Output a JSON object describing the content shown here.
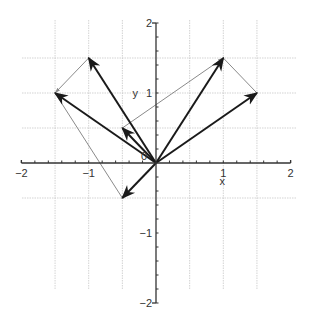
{
  "diagram": {
    "title": "",
    "axes": {
      "x_label": "x",
      "y_label": "y",
      "x_ticks": [
        {
          "value": -2,
          "label": "−2"
        },
        {
          "value": -1,
          "label": "−1"
        },
        {
          "value": 1,
          "label": "1"
        },
        {
          "value": 2,
          "label": "2"
        }
      ],
      "y_ticks": [
        {
          "value": 2,
          "label": "2"
        },
        {
          "value": 1,
          "label": "1"
        },
        {
          "value": -1,
          "label": "−1"
        },
        {
          "value": -2,
          "label": "−2"
        }
      ],
      "origin_label": "0",
      "xlim": [
        -2,
        2
      ],
      "ylim": [
        -2,
        2
      ],
      "grid_step": 0.5
    },
    "vectors": [
      {
        "from": [
          0,
          0
        ],
        "to": [
          -1,
          1.5
        ],
        "style": "bold-arrow"
      },
      {
        "from": [
          0,
          0
        ],
        "to": [
          -1.5,
          1
        ],
        "style": "bold-arrow"
      },
      {
        "from": [
          0,
          0
        ],
        "to": [
          1,
          1.5
        ],
        "style": "bold-arrow"
      },
      {
        "from": [
          0,
          0
        ],
        "to": [
          1.5,
          1
        ],
        "style": "bold-arrow"
      },
      {
        "from": [
          0,
          0
        ],
        "to": [
          -0.5,
          0.5
        ],
        "style": "bold-arrow"
      },
      {
        "from": [
          0,
          0
        ],
        "to": [
          -0.5,
          -0.5
        ],
        "style": "bold-arrow"
      }
    ],
    "segments": [
      {
        "from": [
          -1,
          1.5
        ],
        "to": [
          -1.5,
          1
        ],
        "style": "thin-arrow"
      },
      {
        "from": [
          1,
          1.5
        ],
        "to": [
          1.5,
          1
        ],
        "style": "thin"
      },
      {
        "from": [
          -1.5,
          1
        ],
        "to": [
          -0.5,
          -0.5
        ],
        "style": "thin"
      },
      {
        "from": [
          -0.5,
          0.5
        ],
        "to": [
          1,
          1.5
        ],
        "style": "thin-arrow"
      }
    ],
    "colors": {
      "axis": "#333333",
      "grid": "#c8c8c8",
      "vector": "#1a1a1a",
      "segment": "#8a8a8a"
    }
  }
}
